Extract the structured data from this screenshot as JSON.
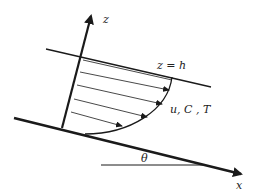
{
  "diagram": {
    "type": "inclined-layer-profile",
    "labels": {
      "z_axis": "z",
      "x_axis": "x",
      "top_surface": "z = h",
      "profile": "u, C , T",
      "angle": "θ"
    },
    "colors": {
      "stroke": "#1a1a1a",
      "background": "#ffffff"
    },
    "profile_arrow_count": 5
  }
}
